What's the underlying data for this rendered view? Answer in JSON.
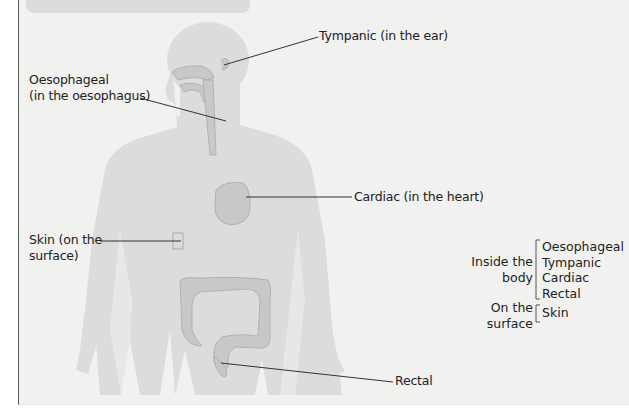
{
  "figure": {
    "labels": {
      "tympanic": "Tympanic (in the ear)",
      "oesophageal_line1": "Oesophageal",
      "oesophageal_line2": "(in the oesophagus)",
      "cardiac": "Cardiac (in the heart)",
      "skin_line1": "Skin (on the",
      "skin_line2": "surface)",
      "rectal": "Rectal"
    },
    "legend": {
      "groups": [
        {
          "heading_line1": "Inside the",
          "heading_line2": "body",
          "items": [
            "Oesophageal",
            "Tympanic",
            "Cardiac",
            "Rectal"
          ]
        },
        {
          "heading_line1": "On the",
          "heading_line2": "surface",
          "items": [
            "Skin"
          ]
        }
      ]
    },
    "colors": {
      "background": "#f1f1f0",
      "body_silhouette": "#dcdcdc",
      "organ": "#c8c8c8",
      "organ_outline": "#a9a9a9",
      "leader_line": "#333333",
      "text": "#222222"
    }
  }
}
